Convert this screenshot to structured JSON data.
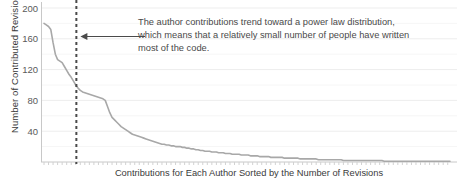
{
  "chart_data": {
    "type": "line",
    "title": "",
    "xlabel": "Contributions for Each Author Sorted by the Number of Revisions",
    "ylabel": "Number of Contributed Revisions",
    "ylim": [
      0,
      200
    ],
    "yticks": [
      200,
      160,
      120,
      80,
      40
    ],
    "grid": true,
    "legend": "none",
    "xticklabels": [],
    "series": [
      {
        "name": "Contributed revisions per author",
        "values": [
          180,
          178,
          176,
          172,
          155,
          140,
          133,
          131,
          129,
          124,
          119,
          114,
          110,
          105,
          100,
          96,
          93,
          91,
          90,
          89,
          88,
          87,
          86,
          85,
          84,
          83,
          82,
          80,
          72,
          64,
          58,
          55,
          52,
          49,
          46,
          44,
          42,
          40,
          38,
          36,
          35,
          34,
          33,
          32,
          31,
          30,
          29,
          28,
          27,
          26,
          25,
          24,
          23,
          23,
          22,
          22,
          21,
          21,
          20,
          20,
          20,
          19,
          19,
          18,
          18,
          17,
          17,
          16,
          16,
          15,
          15,
          14,
          14,
          14,
          13,
          13,
          13,
          12,
          12,
          12,
          11,
          11,
          11,
          10,
          10,
          10,
          10,
          9,
          9,
          9,
          9,
          8,
          8,
          8,
          8,
          7,
          7,
          7,
          7,
          7,
          6,
          6,
          6,
          6,
          6,
          6,
          5,
          5,
          5,
          5,
          5,
          5,
          5,
          4,
          4,
          4,
          4,
          4,
          4,
          4,
          4,
          3,
          3,
          3,
          3,
          3,
          3,
          3,
          3,
          3,
          3,
          3,
          2,
          2,
          2,
          2,
          2,
          2,
          2,
          2,
          2,
          2,
          2,
          2,
          2,
          2,
          2,
          2,
          2,
          2,
          1,
          1,
          1,
          1,
          1,
          1,
          1,
          1,
          1,
          1,
          1,
          1,
          1,
          1,
          1,
          1,
          1,
          1,
          1,
          1,
          1,
          1,
          1,
          1,
          1,
          1,
          1,
          1,
          1,
          1
        ]
      }
    ],
    "annotations": {
      "text_lines": [
        "The author contributions trend toward a power law distribution,",
        "which means that a relatively small number of people have written",
        "most of the code."
      ],
      "marker_line": {
        "type": "vertical-dashed",
        "x_fraction": 0.085
      },
      "arrow": {
        "direction": "left",
        "points_to_fraction": 0.085,
        "y_value": 163
      }
    },
    "colors": {
      "line": "#a8a8a8",
      "grid": "#ededed",
      "axis": "#c8c8c8",
      "text": "#3a3a3a",
      "tick_text": "#5a5a5a",
      "annotation_text": "#4a4a4a",
      "marker": "#4a4a4a",
      "background": "#ffffff"
    }
  }
}
